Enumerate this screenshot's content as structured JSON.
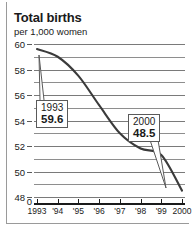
{
  "figure": {
    "title": "Total births",
    "subtitle": "per 1,000 women"
  },
  "chart_data": {
    "type": "line",
    "title": "Total births",
    "subtitle": "per 1,000 women",
    "xlabel": "",
    "ylabel": "per 1,000 women",
    "categories": [
      "1993",
      "'94",
      "'95",
      "'96",
      "'97",
      "'98",
      "'99",
      "2000"
    ],
    "x": [
      1993,
      1994,
      1995,
      1996,
      1997,
      1998,
      1999,
      2000
    ],
    "values": [
      59.6,
      59.0,
      57.5,
      55.2,
      53.0,
      51.8,
      51.3,
      48.5
    ],
    "ylim": [
      48,
      60
    ],
    "ytick_labels": [
      "60",
      "58",
      "56",
      "54",
      "52",
      "50",
      "48"
    ],
    "ytick_values": [
      60,
      58,
      56,
      54,
      52,
      50,
      48
    ],
    "minor_gridline_values": [
      59,
      57,
      55,
      53,
      51,
      49
    ],
    "axis_break_label": "0",
    "grid": true,
    "legend": null,
    "annotations": [
      {
        "year": "1993",
        "value": "59.6"
      },
      {
        "year": "2000",
        "value": "48.5"
      }
    ]
  },
  "colors": {
    "line": "#3b3b3b",
    "grid": "#8e8e8e",
    "text": "#1a1a1a",
    "frame": "#9a9a9a",
    "background": "#ffffff"
  }
}
